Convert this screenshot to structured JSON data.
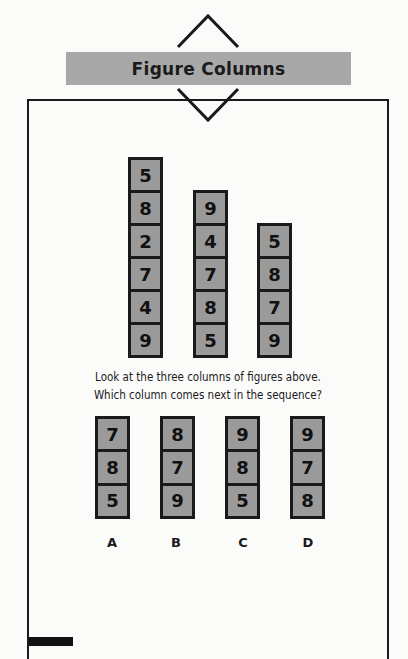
{
  "header": {
    "title": "Figure Columns"
  },
  "sequence_columns": [
    {
      "values": [
        "5",
        "8",
        "2",
        "7",
        "4",
        "9"
      ]
    },
    {
      "values": [
        "9",
        "4",
        "7",
        "8",
        "5"
      ]
    },
    {
      "values": [
        "5",
        "8",
        "7",
        "9"
      ]
    }
  ],
  "question": {
    "line1": "Look at the three columns of figures above.",
    "line2": "Which column comes next in the sequence?"
  },
  "options": [
    {
      "label": "A",
      "values": [
        "7",
        "8",
        "5"
      ]
    },
    {
      "label": "B",
      "values": [
        "8",
        "7",
        "9"
      ]
    },
    {
      "label": "C",
      "values": [
        "9",
        "8",
        "5"
      ]
    },
    {
      "label": "D",
      "values": [
        "9",
        "7",
        "8"
      ]
    }
  ],
  "colors": {
    "title_bar": "#a8a8a8",
    "cell_fill": "#9a9a9a",
    "border": "#1a1a1a"
  }
}
